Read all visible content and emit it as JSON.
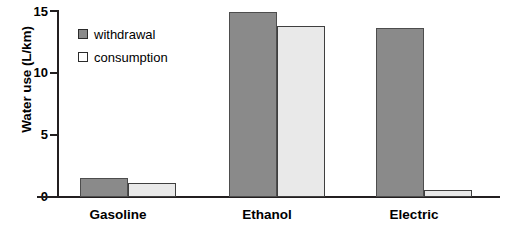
{
  "chart_data": {
    "type": "bar",
    "title": "",
    "xlabel": "",
    "ylabel": "Water use (L/km)",
    "ylim": [
      0,
      15
    ],
    "yticks": [
      0,
      5,
      10,
      15
    ],
    "ytick_labels": [
      "0",
      "5",
      "10",
      "15"
    ],
    "grid": false,
    "legend_position": "upper-left-inside",
    "categories": [
      "Gasoline",
      "Ethanol",
      "Electric"
    ],
    "series": [
      {
        "name": "withdrawal",
        "color": "#8a8a8a",
        "values": [
          1.5,
          14.9,
          13.6
        ]
      },
      {
        "name": "consumption",
        "color": "#e9e9e9",
        "values": [
          1.1,
          13.8,
          0.55
        ]
      }
    ]
  },
  "axis": {
    "y_title": "Water use (L/km)",
    "y_tick_labels": [
      "15",
      "10",
      "5",
      "0"
    ]
  },
  "legend": {
    "items": [
      {
        "label": "withdrawal",
        "swatch": "filled-gray-square-icon"
      },
      {
        "label": "consumption",
        "swatch": "outlined-white-square-icon"
      }
    ]
  },
  "categories": [
    {
      "label": "Gasoline"
    },
    {
      "label": "Ethanol"
    },
    {
      "label": "Electric"
    }
  ]
}
